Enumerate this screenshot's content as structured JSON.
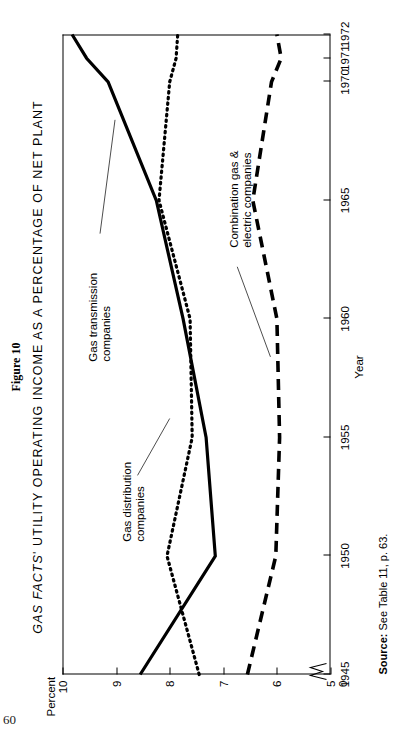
{
  "page": {
    "folio": "60"
  },
  "figure": {
    "number_label": "Figure 10",
    "title_part1": "GAS FACTS",
    "title_part2": "' UTILITY OPERATING INCOME AS A PERCENTAGE OF NET PLANT",
    "source": "See Table 11, p. 63.",
    "source_prefix": "Source:"
  },
  "chart_data": {
    "type": "line",
    "title": "GAS FACTS' UTILITY OPERATING INCOME AS A PERCENTAGE OF NET PLANT",
    "xlabel": "Year",
    "ylabel": "Percent",
    "xlim": [
      1945,
      1972
    ],
    "ylim": [
      5,
      10
    ],
    "yaxis_break": true,
    "y_zero_label": "0",
    "grid": false,
    "legend": "annotated-inline",
    "xticks": [
      1945,
      1950,
      1955,
      1960,
      1965,
      1970,
      1971,
      1972
    ],
    "xtick_labels": [
      "1945",
      "1950",
      "1955",
      "1960",
      "1965",
      "1970",
      "1971",
      "1972"
    ],
    "yticks": [
      5,
      6,
      7,
      8,
      9,
      10
    ],
    "ytick_labels": [
      "5",
      "6",
      "7",
      "8",
      "9",
      "10"
    ],
    "x": [
      1945,
      1950,
      1955,
      1960,
      1965,
      1970,
      1971,
      1972
    ],
    "series": [
      {
        "name": "Gas transmission companies",
        "style": "solid",
        "values": [
          8.55,
          7.15,
          7.32,
          7.75,
          8.25,
          9.15,
          9.55,
          9.82
        ],
        "label_lines": [
          "Gas transmission",
          "companies"
        ]
      },
      {
        "name": "Gas distribution companies",
        "style": "dotted",
        "values": [
          7.45,
          8.05,
          7.58,
          7.62,
          8.2,
          8.0,
          7.88,
          7.85
        ],
        "label_lines": [
          "Gas distribution",
          "companies"
        ]
      },
      {
        "name": "Combination gas & electric companies",
        "style": "dashed",
        "values": [
          6.55,
          6.02,
          5.95,
          6.0,
          6.45,
          6.1,
          5.92,
          6.0
        ],
        "label_lines": [
          "Combination gas &",
          "electric companies"
        ]
      }
    ]
  },
  "colors": {
    "ink": "#000000",
    "paper": "#ffffff"
  }
}
